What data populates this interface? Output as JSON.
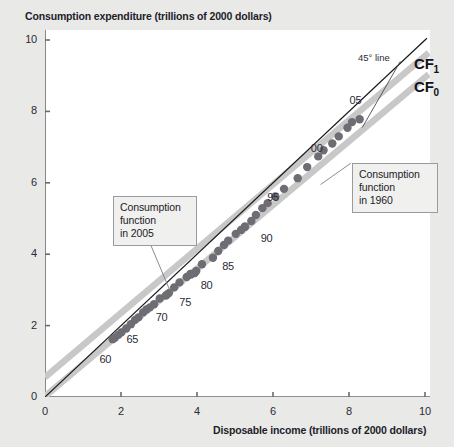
{
  "chart_data": {
    "type": "scatter",
    "title": "Consumption expenditure (trillions of 2000 dollars)",
    "xlabel": "Disposable income (trillions of 2000 dollars)",
    "ylabel": "Consumption expenditure (trillions of 2000 dollars)",
    "xlim": [
      0,
      10
    ],
    "ylim": [
      0,
      10
    ],
    "xticks": [
      "0",
      "2",
      "4",
      "6",
      "8",
      "10"
    ],
    "yticks": [
      "0",
      "2",
      "4",
      "6",
      "8",
      "10"
    ],
    "grid": false,
    "legend_position": "upper-right inline labels",
    "series": [
      {
        "name": "Consumption expenditure data points",
        "type": "scatter",
        "marker_color": "#6d6d73",
        "points": [
          {
            "year": "1960",
            "x": 1.78,
            "y": 1.62
          },
          {
            "year": "1961",
            "x": 1.84,
            "y": 1.66
          },
          {
            "year": "1962",
            "x": 1.93,
            "y": 1.74
          },
          {
            "year": "1963",
            "x": 2.01,
            "y": 1.81
          },
          {
            "year": "1964",
            "x": 2.14,
            "y": 1.92
          },
          {
            "year": "1965",
            "x": 2.26,
            "y": 2.04
          },
          {
            "year": "1966",
            "x": 2.37,
            "y": 2.16
          },
          {
            "year": "1967",
            "x": 2.46,
            "y": 2.23
          },
          {
            "year": "1968",
            "x": 2.58,
            "y": 2.37
          },
          {
            "year": "1969",
            "x": 2.67,
            "y": 2.45
          },
          {
            "year": "1970",
            "x": 2.76,
            "y": 2.51
          },
          {
            "year": "1971",
            "x": 2.87,
            "y": 2.6
          },
          {
            "year": "1972",
            "x": 3.02,
            "y": 2.76
          },
          {
            "year": "1973",
            "x": 3.2,
            "y": 2.86
          },
          {
            "year": "1974",
            "x": 3.18,
            "y": 2.84
          },
          {
            "year": "1975",
            "x": 3.26,
            "y": 2.91
          },
          {
            "year": "1976",
            "x": 3.4,
            "y": 3.07
          },
          {
            "year": "1977",
            "x": 3.54,
            "y": 3.21
          },
          {
            "year": "1978",
            "x": 3.73,
            "y": 3.36
          },
          {
            "year": "1979",
            "x": 3.83,
            "y": 3.45
          },
          {
            "year": "1980",
            "x": 3.84,
            "y": 3.43
          },
          {
            "year": "1981",
            "x": 3.94,
            "y": 3.47
          },
          {
            "year": "1982",
            "x": 3.98,
            "y": 3.53
          },
          {
            "year": "1983",
            "x": 4.13,
            "y": 3.72
          },
          {
            "year": "1984",
            "x": 4.42,
            "y": 3.9
          },
          {
            "year": "1985",
            "x": 4.56,
            "y": 4.09
          },
          {
            "year": "1986",
            "x": 4.71,
            "y": 4.26
          },
          {
            "year": "1987",
            "x": 4.82,
            "y": 4.38
          },
          {
            "year": "1988",
            "x": 5.02,
            "y": 4.57
          },
          {
            "year": "1989",
            "x": 5.16,
            "y": 4.68
          },
          {
            "year": "1990",
            "x": 5.26,
            "y": 4.77
          },
          {
            "year": "1991",
            "x": 5.26,
            "y": 4.77
          },
          {
            "year": "1992",
            "x": 5.43,
            "y": 4.93
          },
          {
            "year": "1993",
            "x": 5.55,
            "y": 5.1
          },
          {
            "year": "1994",
            "x": 5.72,
            "y": 5.29
          },
          {
            "year": "1995",
            "x": 5.86,
            "y": 5.43
          },
          {
            "year": "1996",
            "x": 6.06,
            "y": 5.62
          },
          {
            "year": "1997",
            "x": 6.29,
            "y": 5.83
          },
          {
            "year": "1998",
            "x": 6.65,
            "y": 6.13
          },
          {
            "year": "1999",
            "x": 6.9,
            "y": 6.44
          },
          {
            "year": "2000",
            "x": 7.19,
            "y": 6.74
          },
          {
            "year": "2001",
            "x": 7.33,
            "y": 6.91
          },
          {
            "year": "2002",
            "x": 7.56,
            "y": 7.1
          },
          {
            "year": "2003",
            "x": 7.73,
            "y": 7.3
          },
          {
            "year": "2004",
            "x": 7.96,
            "y": 7.54
          },
          {
            "year": "2005",
            "x": 8.08,
            "y": 7.7
          },
          {
            "year": "2006",
            "x": 8.28,
            "y": 7.78
          }
        ]
      },
      {
        "name": "CF1",
        "label": "CF",
        "subscript": "1",
        "type": "line",
        "description": "Consumption function in 2005",
        "color": "#c8c8c8",
        "intercept": 0.55,
        "slope": 0.9
      },
      {
        "name": "CF0",
        "label": "CF",
        "subscript": "0",
        "type": "line",
        "description": "Consumption function in 1960",
        "color": "#c8c8c8",
        "intercept": -0.05,
        "slope": 0.9
      },
      {
        "name": "45 degree line",
        "type": "line",
        "color": "#1a1a1a",
        "intercept": 0,
        "slope": 1
      }
    ],
    "point_year_labels": [
      {
        "text": "60",
        "x": 1.62,
        "y": 1.05
      },
      {
        "text": "65",
        "x": 2.33,
        "y": 1.6
      },
      {
        "text": "70",
        "x": 3.1,
        "y": 2.22
      },
      {
        "text": "75",
        "x": 3.72,
        "y": 2.62
      },
      {
        "text": "80",
        "x": 4.28,
        "y": 3.12
      },
      {
        "text": "85",
        "x": 4.85,
        "y": 3.64
      },
      {
        "text": "90",
        "x": 5.86,
        "y": 4.42
      },
      {
        "text": "95",
        "x": 6.03,
        "y": 5.57
      },
      {
        "text": "00",
        "x": 7.18,
        "y": 6.95
      },
      {
        "text": "05",
        "x": 8.2,
        "y": 8.28
      }
    ],
    "annotations": [
      {
        "name": "45-degree-line-label",
        "text": "45° line"
      },
      {
        "name": "callout-1960",
        "lines": [
          "Consumption",
          "function",
          "in 1960"
        ]
      },
      {
        "name": "callout-2005",
        "lines": [
          "Consumption",
          "function",
          "in 2005"
        ]
      }
    ],
    "colors": {
      "background": "#e9e9e7",
      "plot_background": "#ffffff",
      "axis": "#6a6a70",
      "marker": "#6d6d73",
      "cf_line": "#c8c8c8",
      "reference_line": "#1a1a1a",
      "text": "#1d1d2b"
    }
  }
}
